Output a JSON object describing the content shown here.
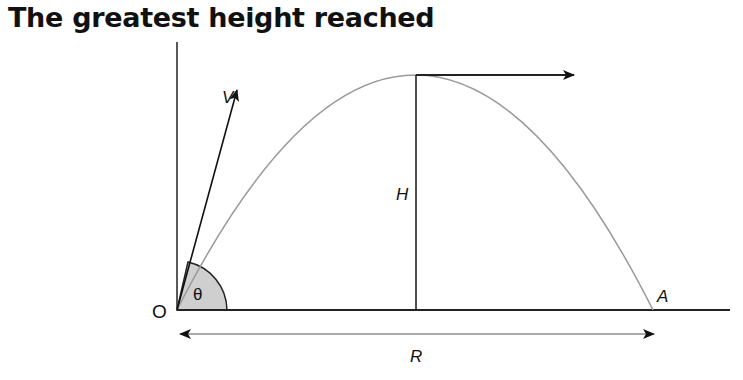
{
  "title": "The greatest height reached",
  "labels": {
    "velocity": "V",
    "height": "H",
    "range": "R",
    "origin": "O",
    "landing_point": "A",
    "angle": "θ"
  },
  "colors": {
    "trajectory": "#9a9a9a",
    "lines": "#222222",
    "angle_fill": "#cfcfcf"
  }
}
